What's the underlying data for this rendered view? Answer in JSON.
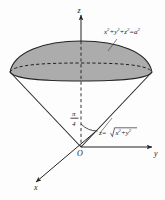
{
  "figure": {
    "background_color": "#fdfdfd",
    "ink_color": "#232323",
    "fill_color": "#a8a8a8",
    "axes": {
      "z_label": "z",
      "y_label": "y",
      "x_label": "x",
      "origin_label": "O"
    },
    "annotations": {
      "sphere_equation": {
        "parts": [
          {
            "text": "x",
            "sup": "2"
          },
          {
            "text": "+y",
            "sup": "2"
          },
          {
            "text": "+z",
            "sup": "2"
          },
          {
            "text": "=a",
            "sup": "2"
          }
        ],
        "plain": "x2+y2+z2=a2"
      },
      "cone_equation": {
        "lead": "z=",
        "radicand_parts": [
          {
            "text": "x",
            "sup": "2"
          },
          {
            "text": "+y",
            "sup": "2"
          }
        ],
        "plain": "z=sqrt(x2+y2)"
      },
      "angle": {
        "numerator": "π",
        "denominator": "4",
        "plain": "pi/4"
      }
    },
    "geometry": {
      "origin": {
        "x": 81,
        "y": 147
      },
      "cap_apex": {
        "x": 81,
        "y": 41
      },
      "rim_left": {
        "x": 10,
        "y": 72
      },
      "rim_right": {
        "x": 152,
        "y": 72
      },
      "rim_ellipse_ry": 9,
      "z_axis_top": {
        "x": 81,
        "y": 12
      },
      "y_axis_end": {
        "x": 158,
        "y": 147
      },
      "x_axis_end": {
        "x": 32,
        "y": 186
      }
    }
  }
}
